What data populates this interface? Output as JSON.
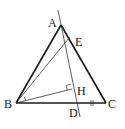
{
  "diagram": {
    "type": "geometry-figure",
    "colors": {
      "stroke": "#1a1a1a",
      "background": "#ffffff"
    },
    "points": {
      "A": {
        "label": "A",
        "x": 61,
        "y": 25
      },
      "B": {
        "label": "B",
        "x": 16,
        "y": 103
      },
      "C": {
        "label": "C",
        "x": 106,
        "y": 103
      },
      "D": {
        "label": "D",
        "x": 75,
        "y": 103
      },
      "E": {
        "label": "E",
        "x": 69,
        "y": 38
      },
      "H": {
        "label": "H",
        "x": 72,
        "y": 89
      }
    },
    "segments": [
      {
        "from": "A",
        "to": "B",
        "style": "bold"
      },
      {
        "from": "A",
        "to": "C",
        "style": "bold"
      },
      {
        "from": "B",
        "to": "C",
        "style": "bold"
      },
      {
        "from": "B",
        "to": "E",
        "style": "thin"
      },
      {
        "from": "B",
        "to": "H",
        "style": "thin"
      },
      {
        "from": "A",
        "to": "D",
        "style": "thin-extended"
      }
    ],
    "marks": {
      "right_angle_at": "H",
      "equal_tick_on": "DC",
      "angle_arc_at": "B",
      "angle_mark_at": "A"
    },
    "labels": {
      "A": "A",
      "B": "B",
      "C": "C",
      "D": "D",
      "E": "E",
      "H": "H"
    }
  }
}
